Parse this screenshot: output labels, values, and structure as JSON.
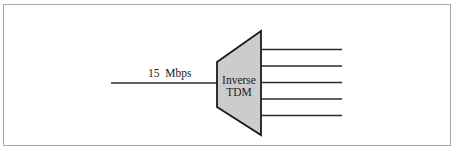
{
  "diagram": {
    "input": {
      "label": "15  Mbps",
      "line_count": 1
    },
    "block": {
      "line1": "Inverse",
      "line2": "TDM",
      "fill": "#cccccc",
      "stroke": "#1a1a1a"
    },
    "outputs": {
      "line_count": 5
    }
  }
}
